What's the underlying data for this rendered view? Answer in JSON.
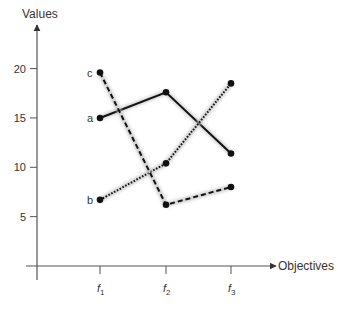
{
  "chart_data": {
    "type": "line",
    "title": "",
    "xlabel": "Objectives",
    "ylabel": "Values",
    "categories": [
      "f1",
      "f2",
      "f3"
    ],
    "category_labels": [
      {
        "base": "f",
        "sub": "1"
      },
      {
        "base": "f",
        "sub": "2"
      },
      {
        "base": "f",
        "sub": "3"
      }
    ],
    "yticks": [
      5,
      10,
      15,
      20
    ],
    "ylim": [
      0,
      24
    ],
    "grid": false,
    "legend": "none (series labeled inline at left)",
    "series": [
      {
        "name": "a",
        "style": "solid",
        "values": [
          15,
          17.6,
          11.4
        ]
      },
      {
        "name": "b",
        "style": "dotted",
        "values": [
          6.7,
          10.4,
          18.5
        ]
      },
      {
        "name": "c",
        "style": "dashed",
        "values": [
          19.6,
          6.2,
          8.0
        ]
      }
    ]
  },
  "colors": {
    "line": "#111111",
    "axis": "#555555",
    "text": "#333333"
  }
}
